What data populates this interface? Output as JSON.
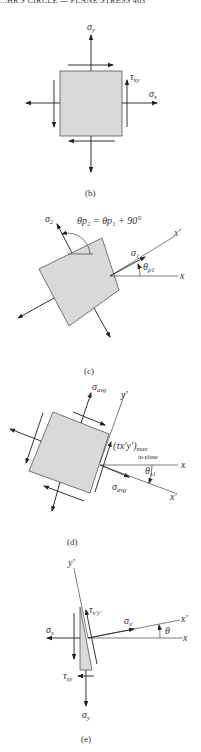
{
  "header": {
    "text": "...HR'S CIRCLE — PLANE STRESS   463"
  },
  "panels": {
    "b": {
      "caption": "(b)",
      "labels": {
        "sigma_y": "σ",
        "sigma_y_sub": "y",
        "sigma_x": "σ",
        "sigma_x_sub": "x",
        "tau_xy": "τ",
        "tau_xy_sub": "xy"
      }
    },
    "c": {
      "caption": "(c)",
      "labels": {
        "sigma_2": "σ",
        "sigma_2_sub": "2",
        "sigma_1": "σ",
        "sigma_1_sub": "1",
        "equation": "θp₂ = θp₁ + 90°",
        "theta_p1": "θ",
        "theta_p1_sub": "p1",
        "x_prime": "x′",
        "x": "x"
      }
    },
    "d": {
      "caption": "(d)",
      "labels": {
        "sigma_avg_top": "σ",
        "sigma_avg_top_sub": "avg",
        "sigma_avg_right": "σ",
        "sigma_avg_right_sub": "avg",
        "tau_max": "(τx′y′)",
        "tau_max_sub": "max",
        "in_plane": "in-plane",
        "theta_s1": "θ",
        "theta_s1_sub": "s1",
        "y_prime": "y′",
        "x": "x",
        "x_prime": "x′"
      }
    },
    "e": {
      "caption": "(e)",
      "labels": {
        "y_prime": "y′",
        "tau_xpyp": "τ",
        "tau_xpyp_sub": "x′y′",
        "sigma_xp": "σ",
        "sigma_xp_sub": "x′",
        "sigma_x": "σ",
        "sigma_x_sub": "x",
        "tau_xy": "τ",
        "tau_xy_sub": "xy",
        "sigma_y": "σ",
        "sigma_y_sub": "y",
        "theta": "θ",
        "x": "x",
        "x_prime": "x′"
      }
    }
  }
}
